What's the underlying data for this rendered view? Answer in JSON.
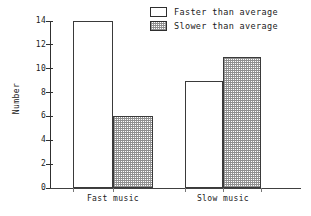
{
  "chart_data": {
    "type": "bar",
    "title": "",
    "subtitle": "",
    "xlabel": "",
    "ylabel": "Number",
    "categories": [
      "Fast music",
      "Slow music"
    ],
    "series": [
      {
        "name": "Faster than average",
        "values": [
          14,
          9
        ],
        "fill": "plain"
      },
      {
        "name": "Slower than average",
        "values": [
          6,
          11
        ],
        "fill": "stipple"
      }
    ],
    "ylim": [
      0,
      14
    ],
    "ytick_labels": [
      "0",
      "2",
      "4",
      "6",
      "8",
      "10",
      "12",
      "14"
    ],
    "ytick_values": [
      0,
      2,
      4,
      6,
      8,
      10,
      12,
      14
    ],
    "grid": false,
    "legend_position": "top-right",
    "annotations": []
  },
  "legend": {
    "entries": [
      {
        "label": "Faster than average",
        "swatch": "plain-swatch"
      },
      {
        "label": "Slower than average",
        "swatch": "stipple-swatch"
      }
    ]
  },
  "colors": {
    "axis": "#303030",
    "bar_outline": "#3a3a3a",
    "plain_fill": "#ffffff",
    "stipple_fill": "#9a9a9a",
    "text": "#1a1a1a",
    "background": "#ffffff"
  }
}
